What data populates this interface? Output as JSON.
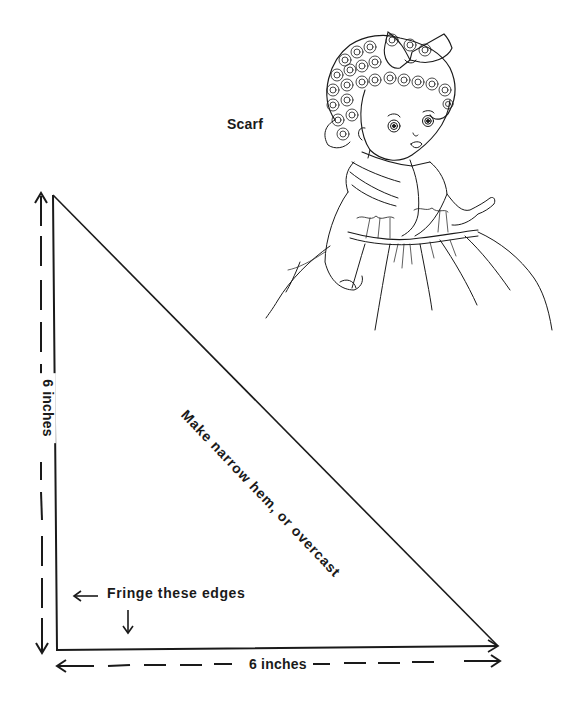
{
  "title": "Scarf",
  "labels": {
    "hypotenuse": "Make narrow hem, or overcast",
    "left_dimension": "6 inches",
    "bottom_dimension": "6 inches",
    "fringe_note": "Fringe these edges"
  },
  "pattern": {
    "shape": "right-triangle",
    "side_a": "6 inches",
    "side_b": "6 inches",
    "vertices": [
      [
        53,
        195
      ],
      [
        57,
        650
      ],
      [
        498,
        646
      ]
    ]
  },
  "illustration": "doll-wearing-scarf",
  "colors": {
    "ink": "#1a1a1a",
    "paper": "#ffffff"
  }
}
